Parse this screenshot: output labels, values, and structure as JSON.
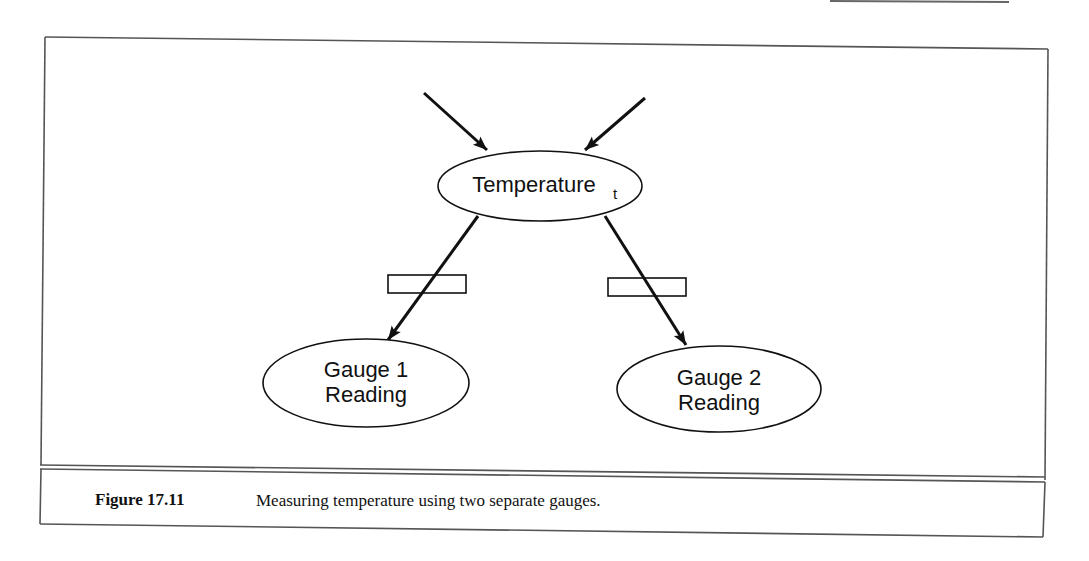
{
  "figure": {
    "number": "Figure 17.11",
    "caption": "Measuring temperature using two separate gauges."
  },
  "nodes": {
    "temperature": {
      "label": "Temperature",
      "subscript": "t"
    },
    "gauge1": {
      "line1": "Gauge 1",
      "line2": "Reading"
    },
    "gauge2": {
      "line1": "Gauge 2",
      "line2": "Reading"
    }
  },
  "edges": [
    {
      "from": "incoming-left",
      "to": "temperature"
    },
    {
      "from": "incoming-right",
      "to": "temperature"
    },
    {
      "from": "temperature",
      "to": "gauge1",
      "cut_marker": true
    },
    {
      "from": "temperature",
      "to": "gauge2",
      "cut_marker": true
    }
  ],
  "colors": {
    "ink": "#111111",
    "frame": "#555555",
    "background": "#ffffff"
  }
}
